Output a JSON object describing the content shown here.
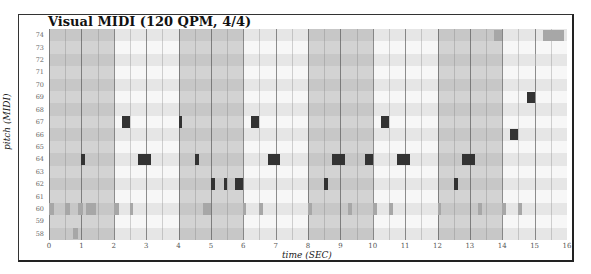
{
  "title": "Visual MIDI (120 QPM, 4/4)",
  "chart_data": {
    "type": "heatmap",
    "subtype": "piano-roll",
    "title": "Visual MIDI (120 QPM, 4/4)",
    "xlabel": "time (SEC)",
    "ylabel": "pitch (MIDI)",
    "xlim": [
      0,
      16
    ],
    "ylim": [
      58,
      74
    ],
    "x_ticks": [
      "0",
      "1",
      "2",
      "3",
      "4",
      "5",
      "6",
      "7",
      "8",
      "9",
      "10",
      "11",
      "12",
      "13",
      "14",
      "15",
      "16"
    ],
    "y_ticks": [
      "74",
      "73",
      "72",
      "71",
      "70",
      "69",
      "68",
      "67",
      "66",
      "65",
      "64",
      "63",
      "62",
      "61",
      "60",
      "59",
      "58"
    ],
    "shaded_bars_sec": [
      [
        0,
        2
      ],
      [
        4,
        6
      ],
      [
        8,
        10
      ],
      [
        12,
        14
      ]
    ],
    "beat_lines_sec": [
      0,
      0.5,
      1,
      1.5,
      2,
      2.5,
      3,
      3.5,
      4,
      4.5,
      5,
      5.5,
      6,
      6.5,
      7,
      7.5,
      8,
      8.5,
      9,
      9.5,
      10,
      10.5,
      11,
      11.5,
      12,
      12.5,
      13,
      13.5,
      14,
      14.5,
      15,
      15.5,
      16
    ],
    "grid": true,
    "legend": null,
    "notes": [
      {
        "pitch": 60,
        "start": 0.0,
        "end": 0.15,
        "velocity": "low"
      },
      {
        "pitch": 60,
        "start": 0.5,
        "end": 0.65,
        "velocity": "low"
      },
      {
        "pitch": 60,
        "start": 0.9,
        "end": 1.05,
        "velocity": "low"
      },
      {
        "pitch": 60,
        "start": 1.15,
        "end": 1.45,
        "velocity": "low"
      },
      {
        "pitch": 58,
        "start": 0.75,
        "end": 0.9,
        "velocity": "low"
      },
      {
        "pitch": 64,
        "start": 1.0,
        "end": 1.1,
        "velocity": "high"
      },
      {
        "pitch": 60,
        "start": 2.0,
        "end": 2.15,
        "velocity": "low"
      },
      {
        "pitch": 60,
        "start": 2.5,
        "end": 2.6,
        "velocity": "low"
      },
      {
        "pitch": 67,
        "start": 2.25,
        "end": 2.5,
        "velocity": "high"
      },
      {
        "pitch": 64,
        "start": 2.75,
        "end": 3.15,
        "velocity": "high"
      },
      {
        "pitch": 67,
        "start": 4.0,
        "end": 4.12,
        "velocity": "high"
      },
      {
        "pitch": 64,
        "start": 4.5,
        "end": 4.62,
        "velocity": "high"
      },
      {
        "pitch": 60,
        "start": 4.75,
        "end": 5.0,
        "velocity": "low"
      },
      {
        "pitch": 62,
        "start": 5.0,
        "end": 5.12,
        "velocity": "high"
      },
      {
        "pitch": 62,
        "start": 5.4,
        "end": 5.5,
        "velocity": "high"
      },
      {
        "pitch": 62,
        "start": 5.75,
        "end": 6.0,
        "velocity": "high"
      },
      {
        "pitch": 60,
        "start": 6.0,
        "end": 6.1,
        "velocity": "low"
      },
      {
        "pitch": 67,
        "start": 6.25,
        "end": 6.5,
        "velocity": "high"
      },
      {
        "pitch": 60,
        "start": 6.5,
        "end": 6.62,
        "velocity": "low"
      },
      {
        "pitch": 64,
        "start": 6.75,
        "end": 7.15,
        "velocity": "high"
      },
      {
        "pitch": 60,
        "start": 8.0,
        "end": 8.12,
        "velocity": "low"
      },
      {
        "pitch": 62,
        "start": 8.5,
        "end": 8.62,
        "velocity": "high"
      },
      {
        "pitch": 64,
        "start": 8.75,
        "end": 9.15,
        "velocity": "high"
      },
      {
        "pitch": 60,
        "start": 9.25,
        "end": 9.37,
        "velocity": "low"
      },
      {
        "pitch": 64,
        "start": 9.75,
        "end": 10.0,
        "velocity": "high"
      },
      {
        "pitch": 60,
        "start": 10.0,
        "end": 10.12,
        "velocity": "low"
      },
      {
        "pitch": 67,
        "start": 10.25,
        "end": 10.5,
        "velocity": "high"
      },
      {
        "pitch": 60,
        "start": 10.5,
        "end": 10.62,
        "velocity": "low"
      },
      {
        "pitch": 64,
        "start": 10.75,
        "end": 11.15,
        "velocity": "high"
      },
      {
        "pitch": 60,
        "start": 12.0,
        "end": 12.12,
        "velocity": "low"
      },
      {
        "pitch": 62,
        "start": 12.5,
        "end": 12.62,
        "velocity": "high"
      },
      {
        "pitch": 64,
        "start": 12.75,
        "end": 13.15,
        "velocity": "high"
      },
      {
        "pitch": 60,
        "start": 13.25,
        "end": 13.37,
        "velocity": "low"
      },
      {
        "pitch": 74,
        "start": 13.75,
        "end": 14.0,
        "velocity": "low"
      },
      {
        "pitch": 60,
        "start": 14.0,
        "end": 14.12,
        "velocity": "low"
      },
      {
        "pitch": 66,
        "start": 14.25,
        "end": 14.5,
        "velocity": "high"
      },
      {
        "pitch": 60,
        "start": 14.5,
        "end": 14.62,
        "velocity": "low"
      },
      {
        "pitch": 69,
        "start": 14.75,
        "end": 15.0,
        "velocity": "high"
      },
      {
        "pitch": 72,
        "start": 15.0,
        "end": 15.05,
        "velocity": "low"
      },
      {
        "pitch": 74,
        "start": 15.25,
        "end": 15.9,
        "velocity": "low"
      }
    ]
  }
}
